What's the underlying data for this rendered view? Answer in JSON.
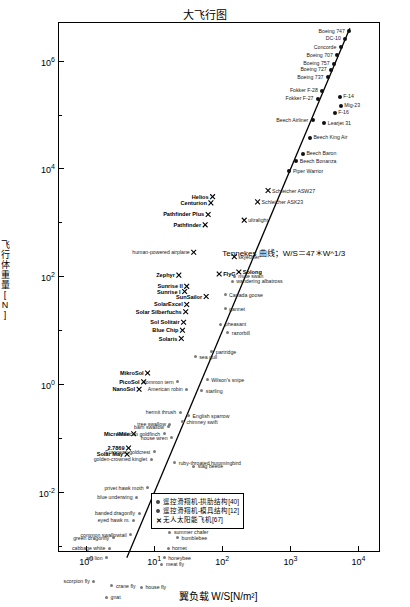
{
  "chart_data": {
    "type": "scatter",
    "title": "大飞行图",
    "xlabel": "翼负载 W/S[N/m²]",
    "ylabel": "飞行体重量[N]",
    "xscale": "log",
    "yscale": "log",
    "xlim": [
      0.4,
      20000
    ],
    "ylim": [
      0.0008,
      5000000
    ],
    "xticks": [
      "10⁰",
      "10¹",
      "10²",
      "10³",
      "10⁴"
    ],
    "yticks": [
      "10⁶",
      "10⁴",
      "10²",
      "10⁰",
      "10⁻²"
    ],
    "grid": false,
    "annotation": "Tennekes 曲线；W/S＝47＊W^1/3",
    "trendline": {
      "label": "W/S = 47 * W^(1/3)",
      "slope_note": "直线斜率 3:1 (log-log)"
    },
    "legend": {
      "position": "bottom-center-inside",
      "entries": [
        {
          "marker": "dot",
          "label": "遥控滑翔机-拱肋结构[40]"
        },
        {
          "marker": "dot",
          "label": "遥控滑翔机-模具结构[12]"
        },
        {
          "marker": "x",
          "label": "无人太阳能飞机[67]"
        }
      ]
    },
    "labeled_points": [
      {
        "name": "Boeing 747",
        "x": 7200,
        "y": 3600000
      },
      {
        "name": "DC-10",
        "x": 6300,
        "y": 2600000
      },
      {
        "name": "Concorde",
        "x": 5400,
        "y": 1800000
      },
      {
        "name": "Boeing 707",
        "x": 4800,
        "y": 1300000
      },
      {
        "name": "Boeing 757",
        "x": 4300,
        "y": 900000
      },
      {
        "name": "Boeing 727",
        "x": 3900,
        "y": 700000
      },
      {
        "name": "Boeing 737",
        "x": 3500,
        "y": 500000
      },
      {
        "name": "Fokker F-28",
        "x": 2900,
        "y": 280000
      },
      {
        "name": "Fokker F-27",
        "x": 2500,
        "y": 200000
      },
      {
        "name": "F-14",
        "x": 5200,
        "y": 220000
      },
      {
        "name": "Mig-23",
        "x": 5400,
        "y": 150000
      },
      {
        "name": "F-16",
        "x": 4400,
        "y": 110000
      },
      {
        "name": "Beech Airliner",
        "x": 2100,
        "y": 80000
      },
      {
        "name": "Learjet 31",
        "x": 3100,
        "y": 70000
      },
      {
        "name": "Beech King Air",
        "x": 1900,
        "y": 38000
      },
      {
        "name": "Beech Bonanza",
        "x": 1200,
        "y": 14000
      },
      {
        "name": "Piper Warrior",
        "x": 950,
        "y": 9000
      },
      {
        "name": "Beech Baron",
        "x": 1500,
        "y": 19000
      },
      {
        "name": "Schleicher ASW27",
        "x": 470,
        "y": 3900
      },
      {
        "name": "Schleicher ASK23",
        "x": 330,
        "y": 2400
      },
      {
        "name": "Helios",
        "x": 72,
        "y": 3000
      },
      {
        "name": "Centurion",
        "x": 68,
        "y": 2300
      },
      {
        "name": "Pathfinder Plus",
        "x": 62,
        "y": 1400
      },
      {
        "name": "Pathfinder",
        "x": 56,
        "y": 900
      },
      {
        "name": "ultralight",
        "x": 210,
        "y": 1100
      },
      {
        "name": "human-powered airplane",
        "x": 38,
        "y": 280
      },
      {
        "name": "skyeurfer",
        "x": 150,
        "y": 230
      },
      {
        "name": "Zephyr",
        "x": 23,
        "y": 105
      },
      {
        "name": "FlyG",
        "x": 90,
        "y": 110
      },
      {
        "name": "Solong",
        "x": 175,
        "y": 120
      },
      {
        "name": "Sunrise II",
        "x": 30,
        "y": 65
      },
      {
        "name": "Sunrise I",
        "x": 28,
        "y": 52
      },
      {
        "name": "wandering albatross",
        "x": 140,
        "y": 80
      },
      {
        "name": "SunSailor",
        "x": 58,
        "y": 42
      },
      {
        "name": "SolarExcel",
        "x": 30,
        "y": 30
      },
      {
        "name": "mute swan",
        "x": 150,
        "y": 100
      },
      {
        "name": "Canada goose",
        "x": 110,
        "y": 45
      },
      {
        "name": "Solar Silberfuchs",
        "x": 29,
        "y": 22
      },
      {
        "name": "Sol Solitair",
        "x": 27,
        "y": 14
      },
      {
        "name": "Blue Chip",
        "x": 26,
        "y": 10
      },
      {
        "name": "Solaris",
        "x": 25,
        "y": 7
      },
      {
        "name": "gannet",
        "x": 110,
        "y": 25
      },
      {
        "name": "pheasant",
        "x": 95,
        "y": 13
      },
      {
        "name": "razorbill",
        "x": 120,
        "y": 9
      },
      {
        "name": "MikroSol",
        "x": 8,
        "y": 1.6
      },
      {
        "name": "PicoSol",
        "x": 7,
        "y": 1.1
      },
      {
        "name": "NanoSol",
        "x": 6,
        "y": 0.8
      },
      {
        "name": "partridge",
        "x": 70,
        "y": 4
      },
      {
        "name": "Wilson's snipe",
        "x": 60,
        "y": 1.2
      },
      {
        "name": "starling",
        "x": 50,
        "y": 0.75
      },
      {
        "name": "American robin",
        "x": 30,
        "y": 0.8
      },
      {
        "name": "common tern",
        "x": 22,
        "y": 1.1
      },
      {
        "name": "sea gull",
        "x": 40,
        "y": 3.2
      },
      {
        "name": "house wren",
        "x": 18,
        "y": 0.1
      },
      {
        "name": "tree swallow",
        "x": 17,
        "y": 0.18
      },
      {
        "name": "barn swallow",
        "x": 16,
        "y": 0.16
      },
      {
        "name": "hermit thrush",
        "x": 24,
        "y": 0.3
      },
      {
        "name": "English sparrow",
        "x": 32,
        "y": 0.26
      },
      {
        "name": "chimney swift",
        "x": 26,
        "y": 0.2
      },
      {
        "name": "MicroMile",
        "x": 5,
        "y": 0.12
      },
      {
        "name": "2.7869",
        "x": 4.2,
        "y": 0.065
      },
      {
        "name": "Solar May",
        "x": 4.0,
        "y": 0.05
      },
      {
        "name": "American goldfinch",
        "x": 14,
        "y": 0.12
      },
      {
        "name": "European goldcrest",
        "x": 10,
        "y": 0.055
      },
      {
        "name": "golden-crowned kinglet",
        "x": 9,
        "y": 0.04
      },
      {
        "name": "ruby-throated hummingbird",
        "x": 20,
        "y": 0.035
      },
      {
        "name": "stag beetle",
        "x": 38,
        "y": 0.03
      },
      {
        "name": "privet hawk moth",
        "x": 8,
        "y": 0.012
      },
      {
        "name": "blue underwing",
        "x": 5.5,
        "y": 0.008
      },
      {
        "name": "banded dragonfly",
        "x": 6,
        "y": 0.004
      },
      {
        "name": "eyed hawk m.",
        "x": 5,
        "y": 0.003
      },
      {
        "name": "cock chafer",
        "x": 20,
        "y": 0.0045
      },
      {
        "name": "dung beetle",
        "x": 18,
        "y": 0.0028
      },
      {
        "name": "little stag beetle",
        "x": 26,
        "y": 0.0024
      },
      {
        "name": "summer chafer",
        "x": 17,
        "y": 0.0018
      },
      {
        "name": "bumblebee",
        "x": 22,
        "y": 0.0014
      },
      {
        "name": "common swallowtail",
        "x": 4.5,
        "y": 0.0016
      },
      {
        "name": "green dragonfly",
        "x": 2.5,
        "y": 0.0014
      },
      {
        "name": "cabbage white",
        "x": 2.2,
        "y": 0.0009
      },
      {
        "name": "hornet",
        "x": 16,
        "y": 0.0009
      },
      {
        "name": "ant lion",
        "x": 2.0,
        "y": 0.0006
      },
      {
        "name": "honeybee",
        "x": 14,
        "y": 0.0006
      },
      {
        "name": "meat fly",
        "x": 13,
        "y": 0.00045
      },
      {
        "name": "scorpion fly",
        "x": 1.3,
        "y": 0.00022
      },
      {
        "name": "crane fly",
        "x": 2.4,
        "y": 0.00018
      },
      {
        "name": "house fly",
        "x": 6.5,
        "y": 0.00017
      },
      {
        "name": "gnat",
        "x": 2.0,
        "y": 0.00011
      }
    ]
  }
}
